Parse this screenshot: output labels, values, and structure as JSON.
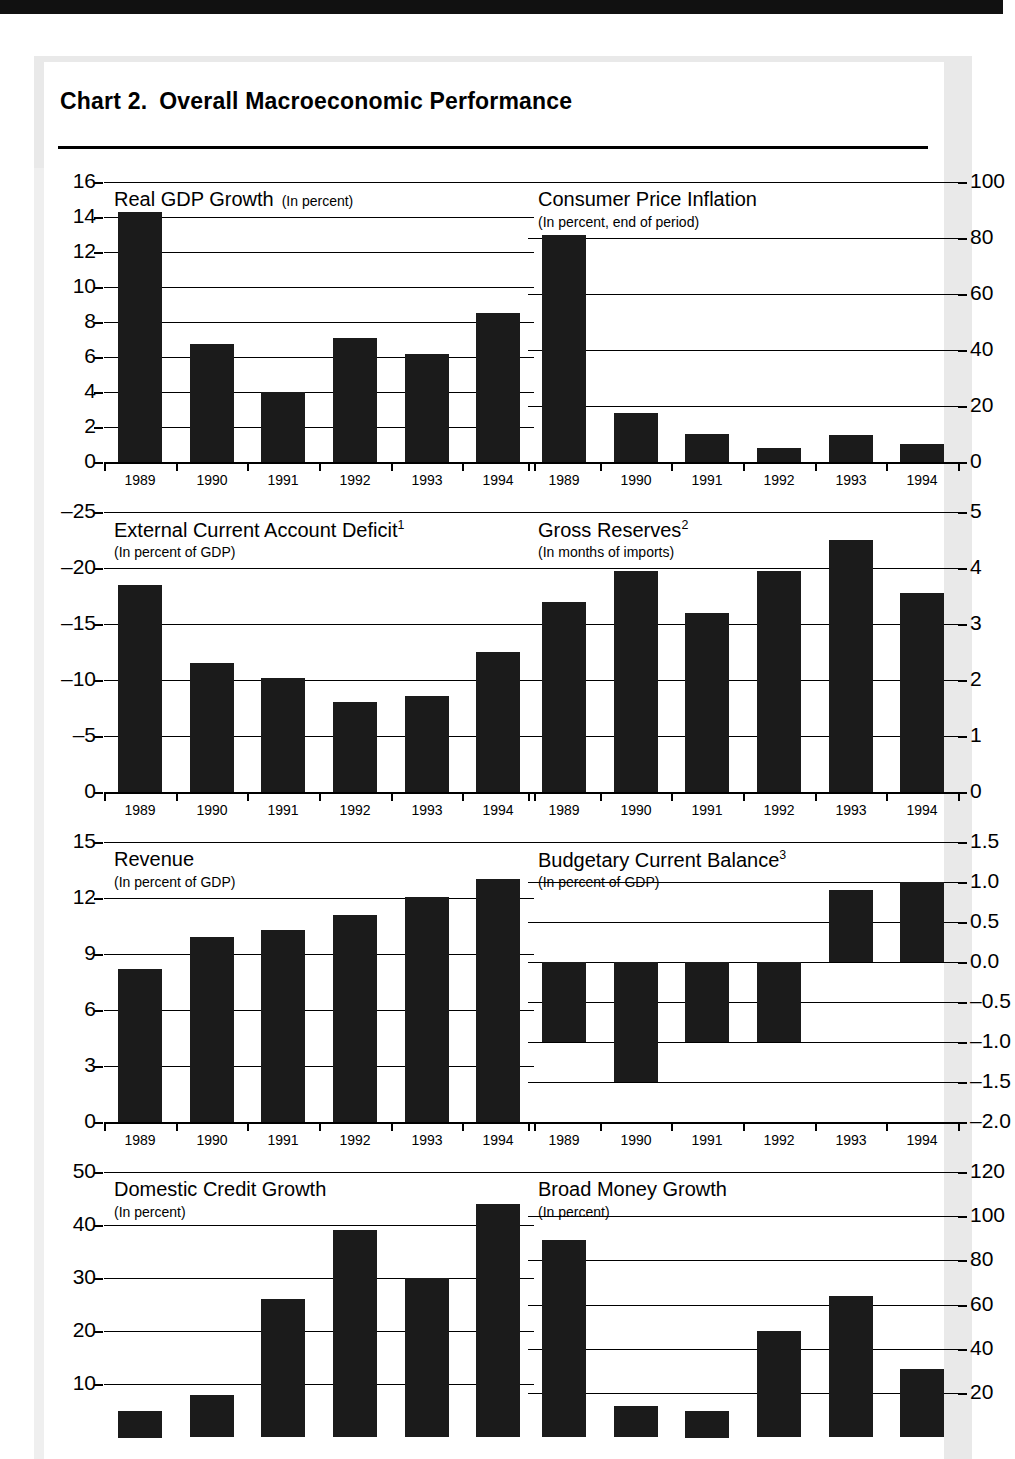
{
  "header": {
    "chart_number": "Chart 2.",
    "title": "Overall Macroeconomic Performance"
  },
  "categories": [
    "1989",
    "1990",
    "1991",
    "1992",
    "1993",
    "1994"
  ],
  "chart_data": [
    {
      "type": "bar",
      "id": "real-gdp-growth",
      "title": "Real GDP Growth",
      "subtitle": "(In percent)",
      "subtitle_inline": true,
      "axis_side": "left",
      "categories": [
        "1989",
        "1990",
        "1991",
        "1992",
        "1993",
        "1994"
      ],
      "values": [
        14.3,
        6.75,
        4.0,
        7.1,
        6.2,
        8.5
      ],
      "ylim": [
        0,
        16
      ],
      "yticks": [
        0,
        2,
        4,
        6,
        8,
        10,
        12,
        14,
        16
      ],
      "ytick_labels": [
        "0",
        "2",
        "4",
        "6",
        "8",
        "10",
        "12",
        "14",
        "16"
      ],
      "grid": true,
      "xlabel": "",
      "ylabel": ""
    },
    {
      "type": "bar",
      "id": "consumer-price-inflation",
      "title": "Consumer Price Inflation",
      "subtitle": "(In percent, end of period)",
      "subtitle_inline": false,
      "axis_side": "right",
      "categories": [
        "1989",
        "1990",
        "1991",
        "1992",
        "1993",
        "1994"
      ],
      "values": [
        81,
        17.5,
        10.0,
        5.0,
        9.5,
        6.5
      ],
      "ylim": [
        0,
        100
      ],
      "yticks": [
        0,
        20,
        40,
        60,
        80,
        100
      ],
      "ytick_labels": [
        "0",
        "20",
        "40",
        "60",
        "80",
        "100"
      ],
      "grid": true,
      "xlabel": "",
      "ylabel": ""
    },
    {
      "type": "bar",
      "id": "external-current-account-deficit",
      "title": "External Current Account Deficit",
      "title_superscript": "1",
      "subtitle": "(In percent of GDP)",
      "subtitle_inline": false,
      "axis_side": "left",
      "inverted": true,
      "categories": [
        "1989",
        "1990",
        "1991",
        "1992",
        "1993",
        "1994"
      ],
      "values": [
        -18.5,
        -11.5,
        -10.2,
        -8.0,
        -8.6,
        -12.5
      ],
      "ylim": [
        0,
        -25
      ],
      "yticks": [
        0,
        -5,
        -10,
        -15,
        -20,
        -25
      ],
      "ytick_labels": [
        "0",
        "–5",
        "–10",
        "–15",
        "–20",
        "–25"
      ],
      "grid": true,
      "xlabel": "",
      "ylabel": ""
    },
    {
      "type": "bar",
      "id": "gross-reserves",
      "title": "Gross Reserves",
      "title_superscript": "2",
      "subtitle": "(In months of imports)",
      "subtitle_inline": false,
      "axis_side": "right",
      "categories": [
        "1989",
        "1990",
        "1991",
        "1992",
        "1993",
        "1994"
      ],
      "values": [
        3.4,
        3.95,
        3.2,
        3.95,
        4.5,
        3.55
      ],
      "ylim": [
        0,
        5
      ],
      "yticks": [
        0,
        1,
        2,
        3,
        4,
        5
      ],
      "ytick_labels": [
        "0",
        "1",
        "2",
        "3",
        "4",
        "5"
      ],
      "grid": true,
      "xlabel": "",
      "ylabel": ""
    },
    {
      "type": "bar",
      "id": "revenue",
      "title": "Revenue",
      "subtitle": "(In percent of GDP)",
      "subtitle_inline": false,
      "axis_side": "left",
      "categories": [
        "1989",
        "1990",
        "1991",
        "1992",
        "1993",
        "1994"
      ],
      "values": [
        8.2,
        9.9,
        10.3,
        11.1,
        12.05,
        13.0
      ],
      "ylim": [
        0,
        15
      ],
      "yticks": [
        0,
        3,
        6,
        9,
        12,
        15
      ],
      "ytick_labels": [
        "0",
        "3",
        "6",
        "9",
        "12",
        "15"
      ],
      "grid": true,
      "xlabel": "",
      "ylabel": ""
    },
    {
      "type": "bar",
      "id": "budgetary-current-balance",
      "title": "Budgetary Current Balance",
      "title_superscript": "3",
      "subtitle": "(In percent of GDP)",
      "subtitle_inline": false,
      "axis_side": "right",
      "categories": [
        "1989",
        "1990",
        "1991",
        "1992",
        "1993",
        "1994"
      ],
      "values": [
        -1.0,
        -1.5,
        -1.0,
        -1.0,
        0.9,
        1.0
      ],
      "ylim": [
        -2.0,
        1.5
      ],
      "yticks": [
        -2.0,
        -1.5,
        -1.0,
        -0.5,
        0.0,
        0.5,
        1.0,
        1.5
      ],
      "ytick_labels": [
        "–2.0",
        "–1.5",
        "–1.0",
        "–0.5",
        "0.0",
        "0.5",
        "1.0",
        "1.5"
      ],
      "zero_line": 0.0,
      "grid": true,
      "xlabel": "",
      "ylabel": ""
    },
    {
      "type": "bar",
      "id": "domestic-credit-growth",
      "title": "Domestic Credit Growth",
      "subtitle": "(In percent)",
      "subtitle_inline": false,
      "axis_side": "left",
      "truncated_bottom": true,
      "categories": [
        "1989",
        "1990",
        "1991",
        "1992",
        "1993",
        "1994"
      ],
      "values": [
        5.0,
        8.0,
        26.0,
        39.0,
        30.0,
        44.0
      ],
      "ylim": [
        0,
        50
      ],
      "yticks": [
        10,
        20,
        30,
        40,
        50
      ],
      "ytick_labels": [
        "10",
        "20",
        "30",
        "40",
        "50"
      ],
      "grid": true,
      "xlabel": "",
      "ylabel": ""
    },
    {
      "type": "bar",
      "id": "broad-money-growth",
      "title": "Broad Money Growth",
      "subtitle": "(In percent)",
      "subtitle_inline": false,
      "axis_side": "right",
      "truncated_bottom": true,
      "categories": [
        "1989",
        "1990",
        "1991",
        "1992",
        "1993",
        "1994"
      ],
      "values": [
        89.0,
        14.0,
        12.0,
        48.0,
        64.0,
        31.0
      ],
      "ylim": [
        0,
        120
      ],
      "yticks": [
        20,
        40,
        60,
        80,
        100,
        120
      ],
      "ytick_labels": [
        "20",
        "40",
        "60",
        "80",
        "100",
        "120"
      ],
      "grid": true,
      "xlabel": "",
      "ylabel": ""
    }
  ]
}
